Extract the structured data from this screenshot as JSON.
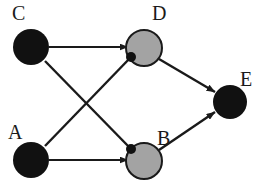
{
  "diagram": {
    "type": "directed-graph",
    "title": "",
    "canvas": {
      "width": 259,
      "height": 182,
      "background": "#ffffff"
    },
    "colors": {
      "node_dark_fill": "#111111",
      "node_gray_fill": "#a3a3a3",
      "node_gray_stroke": "#1a1a1a",
      "edge_stroke": "#1a1a1a",
      "label_color": "#1a1a1a",
      "background": "#ffffff"
    },
    "nodes": [
      {
        "id": "C",
        "label": "C",
        "fill": "dark",
        "cx": 31,
        "cy": 47,
        "r": 18,
        "label_x": 12,
        "label_y": 20
      },
      {
        "id": "D",
        "label": "D",
        "fill": "gray",
        "cx": 144,
        "cy": 48,
        "r": 18,
        "label_x": 152,
        "label_y": 20
      },
      {
        "id": "A",
        "label": "A",
        "fill": "dark",
        "cx": 31,
        "cy": 160,
        "r": 18,
        "label_x": 8,
        "label_y": 139
      },
      {
        "id": "B",
        "label": "B",
        "fill": "gray",
        "cx": 144,
        "cy": 161,
        "r": 18,
        "label_x": 157,
        "label_y": 145
      },
      {
        "id": "E",
        "label": "E",
        "fill": "dark",
        "cx": 230,
        "cy": 102,
        "r": 17,
        "label_x": 240,
        "label_y": 86
      }
    ],
    "edges": [
      {
        "id": "C-D",
        "from": "C",
        "to": "D",
        "head": "triangle",
        "x1": 49,
        "y1": 47,
        "x2": 128,
        "y2": 47
      },
      {
        "id": "A-B",
        "from": "A",
        "to": "B",
        "head": "triangle",
        "x1": 49,
        "y1": 160,
        "x2": 128,
        "y2": 160
      },
      {
        "id": "A-D",
        "from": "A",
        "to": "D",
        "head": "dot",
        "x1": 45,
        "y1": 146,
        "x2": 131,
        "y2": 57
      },
      {
        "id": "C-B",
        "from": "C",
        "to": "B",
        "head": "dot",
        "x1": 45,
        "y1": 61,
        "x2": 131,
        "y2": 149
      },
      {
        "id": "D-E",
        "from": "D",
        "to": "E",
        "head": "triangle",
        "x1": 159,
        "y1": 59,
        "x2": 215,
        "y2": 92
      },
      {
        "id": "B-E",
        "from": "B",
        "to": "E",
        "head": "triangle",
        "x1": 159,
        "y1": 150,
        "x2": 215,
        "y2": 112
      }
    ]
  }
}
